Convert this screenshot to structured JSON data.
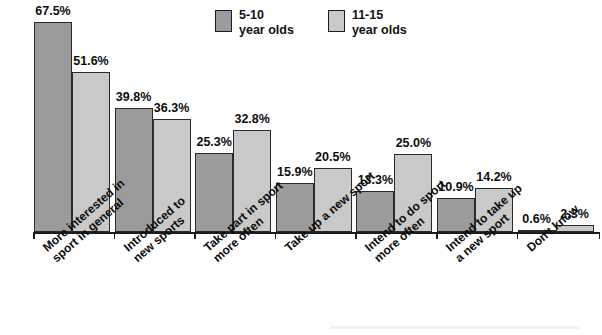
{
  "chart_data": {
    "type": "bar",
    "title": "",
    "xlabel": "",
    "ylabel": "",
    "ylim": [
      0,
      70
    ],
    "grid": false,
    "legend_position": "top-center",
    "value_suffix": "%",
    "categories": [
      "More interested in sport in general",
      "Introduced to new sports",
      "Take part in sport more often",
      "Take up a new sport",
      "Intend to do sport more often",
      "Intend to take up a new sport",
      "Don't know"
    ],
    "category_lines": [
      [
        "More interested in",
        "sport in general"
      ],
      [
        "Introduced to",
        "new sports"
      ],
      [
        "Take part in sport",
        "more often"
      ],
      [
        "Take up a new sport",
        ""
      ],
      [
        "Intend to do sport",
        "more often"
      ],
      [
        "Intend to take up",
        "a new sport"
      ],
      [
        "Don't know",
        ""
      ]
    ],
    "series": [
      {
        "name": "5-10 year olds",
        "color": "#9b9b9b",
        "values": [
          67.5,
          39.8,
          25.3,
          15.9,
          13.3,
          10.9,
          0.6
        ],
        "labels": [
          "67.5%",
          "39.8%",
          "25.3%",
          "15.9%",
          "13.3%",
          "10.9%",
          "0.6%"
        ]
      },
      {
        "name": "11-15 year olds",
        "color": "#c9c9c9",
        "values": [
          51.6,
          36.3,
          32.8,
          20.5,
          25.0,
          14.2,
          2.3
        ],
        "labels": [
          "51.6%",
          "36.3%",
          "32.8%",
          "20.5%",
          "25.0%",
          "14.2%",
          "2.3%"
        ]
      }
    ]
  },
  "legend": {
    "items": [
      {
        "line1": "5-10",
        "line2": "year olds",
        "color": "#9b9b9b"
      },
      {
        "line1": "11-15",
        "line2": "year olds",
        "color": "#c9c9c9"
      }
    ]
  }
}
